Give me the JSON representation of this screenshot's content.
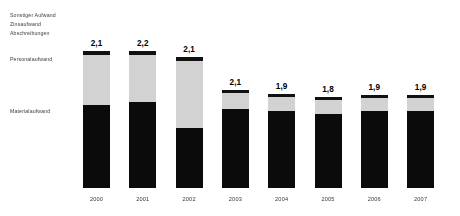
{
  "legend": {
    "top_group": [
      "Sonstiger Aufwand",
      "Zinsaufwand",
      "Abschreibungen"
    ],
    "middle_group": "Personalaufwand",
    "bottom_group": "Materialaufwand"
  },
  "colors": {
    "sonstiger_zins_abschreibungen": "#111111",
    "personalaufwand": "#d2d2d2",
    "materialaufwand": "#0b0b0b",
    "bar_background": "#f7f7f7",
    "canvas": "#ffffff",
    "text": "#1b1b1b"
  },
  "chart_data": {
    "type": "bar",
    "title": "",
    "subtitle": "",
    "xlabel": "",
    "ylabel": "",
    "grid": false,
    "legend_position": "left",
    "stacked": true,
    "categories": [
      "2000",
      "2001",
      "2002",
      "2003",
      "2004",
      "2005",
      "2006",
      "2007"
    ],
    "totals": [
      "2,1",
      "2,2",
      "2,1",
      "2,1",
      "1,9",
      "1,8",
      "1,9",
      "1,9"
    ],
    "total_values": [
      2.1,
      2.2,
      2.1,
      2.1,
      1.9,
      1.8,
      1.9,
      1.9
    ],
    "series": [
      {
        "name": "Sonstiger Aufwand / Zinsaufwand / Abschreibungen",
        "values": [
          0.12,
          0.12,
          0.12,
          0.09,
          0.09,
          0.09,
          0.09,
          0.09
        ]
      },
      {
        "name": "Personalaufwand",
        "values": [
          0.62,
          0.58,
          0.8,
          0.22,
          0.2,
          0.2,
          0.19,
          0.19
        ]
      },
      {
        "name": "Materialaufwand",
        "values": [
          1.36,
          1.5,
          1.18,
          1.8,
          1.61,
          1.51,
          1.62,
          1.62
        ]
      }
    ],
    "bars": [
      {
        "year": "2000",
        "total_label": "2,1",
        "top_px": 4,
        "mid_px": 50,
        "bot_px": 83,
        "stack_top": 36
      },
      {
        "year": "2001",
        "total_label": "2,2",
        "top_px": 4,
        "mid_px": 47,
        "bot_px": 86,
        "stack_top": 36
      },
      {
        "year": "2002",
        "total_label": "2,1",
        "top_px": 4,
        "mid_px": 67,
        "bot_px": 60,
        "stack_top": 42
      },
      {
        "year": "2003",
        "total_label": "2,1",
        "top_px": 3,
        "mid_px": 16,
        "bot_px": 79,
        "stack_top": 62
      },
      {
        "year": "2004",
        "total_label": "1,9",
        "top_px": 3,
        "mid_px": 14,
        "bot_px": 77,
        "stack_top": 66
      },
      {
        "year": "2005",
        "total_label": "1,8",
        "top_px": 3,
        "mid_px": 14,
        "bot_px": 74,
        "stack_top": 69
      },
      {
        "year": "2006",
        "total_label": "1,9",
        "top_px": 3,
        "mid_px": 13,
        "bot_px": 77,
        "stack_top": 67
      },
      {
        "year": "2007",
        "total_label": "1,9",
        "top_px": 3,
        "mid_px": 13,
        "bot_px": 77,
        "stack_top": 67
      }
    ]
  }
}
